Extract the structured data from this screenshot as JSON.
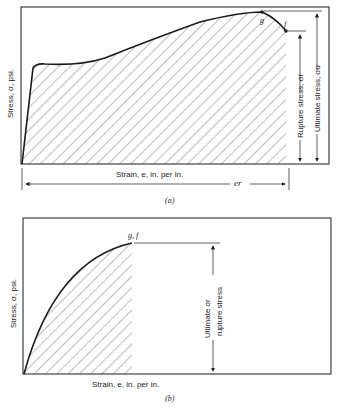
{
  "figure_a": {
    "caption": "(a)",
    "y_axis_label": "Stress, σ, psi.",
    "x_axis_label": "Strain, e, in. per in.",
    "point_g": "g",
    "point_f": "f",
    "rupture_label": "Rupture stress, σr",
    "ultimate_label": "Ultimate stress, σu",
    "strain_rupture_label": "er"
  },
  "figure_b": {
    "caption": "(b)",
    "y_axis_label": "Stress, σ, psi.",
    "x_axis_label": "Strain, e, in. per in.",
    "point_gf": "g, f",
    "stress_label_line1": "Ultimate or",
    "stress_label_line2": "rupture stress"
  },
  "colors": {
    "line": "#1a1a1a",
    "hatch": "#444444",
    "background": "#ffffff"
  }
}
